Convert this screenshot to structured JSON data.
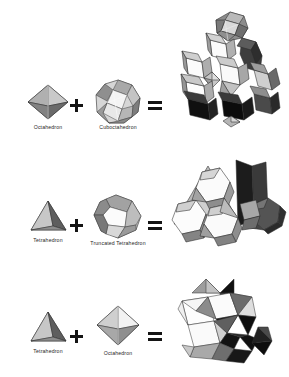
{
  "figure": {
    "background_color": "#ffffff",
    "ink_color": "#1a1a1a",
    "operators": {
      "plus": "+",
      "equals": "="
    }
  },
  "rows": [
    {
      "id": "row-cuboctahedron-octahedron",
      "left": {
        "label": "Octahedron",
        "icon": "octahedron-icon"
      },
      "operator_1": "+",
      "right": {
        "label": "Cuboctahedron",
        "icon": "cuboctahedron-icon"
      },
      "operator_2": "=",
      "result": {
        "label": "",
        "icon": "cuboctahedron-octahedron-honeycomb-icon"
      }
    },
    {
      "id": "row-tetrahedron-truncated-tetrahedron",
      "left": {
        "label": "Tetrahedron",
        "icon": "tetrahedron-icon"
      },
      "operator_1": "+",
      "right": {
        "label": "Truncated Tetrahedron",
        "icon": "truncated-tetrahedron-icon"
      },
      "operator_2": "=",
      "result": {
        "label": "",
        "icon": "truncated-tetrahedral-honeycomb-icon"
      }
    },
    {
      "id": "row-tetrahedron-octahedron",
      "left": {
        "label": "Tetrahedron",
        "icon": "tetrahedron-icon"
      },
      "operator_1": "+",
      "right": {
        "label": "Octahedron",
        "icon": "octahedron-icon"
      },
      "operator_2": "=",
      "result": {
        "label": "",
        "icon": "tetrahedral-octahedral-honeycomb-icon"
      }
    }
  ],
  "palette": {
    "face_white": "#fdfdfd",
    "face_light": "#e2e2e2",
    "face_mid": "#b4b4b4",
    "face_dark": "#7d7d7d",
    "face_darker": "#4a4a4a",
    "face_black": "#111111",
    "edge": "#2b2b2b"
  }
}
